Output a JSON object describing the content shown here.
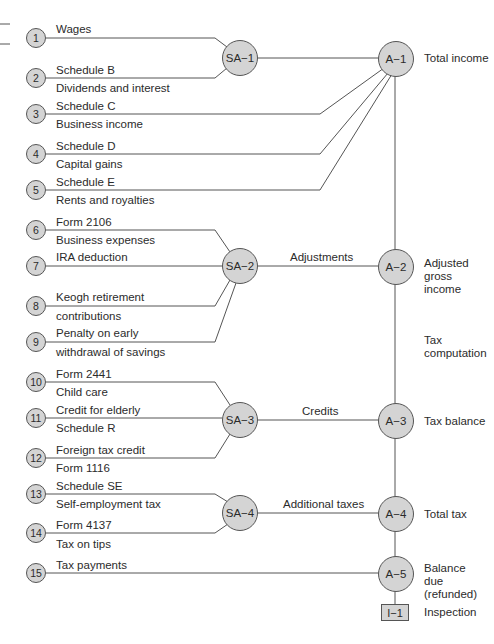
{
  "sources": [
    {
      "num": "1",
      "top": "Wages",
      "bottom": ""
    },
    {
      "num": "2",
      "top": "Schedule B",
      "bottom": "Dividends and interest"
    },
    {
      "num": "3",
      "top": "Schedule C",
      "bottom": "Business income"
    },
    {
      "num": "4",
      "top": "Schedule D",
      "bottom": "Capital gains"
    },
    {
      "num": "5",
      "top": "Schedule E",
      "bottom": "Rents and royalties"
    },
    {
      "num": "6",
      "top": "Form 2106",
      "bottom": "Business expenses"
    },
    {
      "num": "7",
      "top": "IRA deduction",
      "bottom": ""
    },
    {
      "num": "8",
      "top": "Keogh retirement",
      "bottom": "contributions"
    },
    {
      "num": "9",
      "top": "Penalty on early",
      "bottom": "withdrawal of savings"
    },
    {
      "num": "10",
      "top": "Form 2441",
      "bottom": "Child care"
    },
    {
      "num": "11",
      "top": "Credit for elderly",
      "bottom": "Schedule R"
    },
    {
      "num": "12",
      "top": "Foreign tax credit",
      "bottom": "Form 1116"
    },
    {
      "num": "13",
      "top": "Schedule SE",
      "bottom": "Self-employment tax"
    },
    {
      "num": "14",
      "top": "Form 4137",
      "bottom": "Tax on tips"
    },
    {
      "num": "15",
      "top": "Tax payments",
      "bottom": ""
    }
  ],
  "sub_assemblies": [
    {
      "id": "SA−1",
      "edge_label": ""
    },
    {
      "id": "SA−2",
      "edge_label": "Adjustments"
    },
    {
      "id": "SA−3",
      "edge_label": "Credits"
    },
    {
      "id": "SA−4",
      "edge_label": "Additional taxes"
    }
  ],
  "assemblies": [
    {
      "id": "A−1",
      "label": "Total income"
    },
    {
      "id": "A−2",
      "label": "Adjusted gross income"
    },
    {
      "id": "A−3",
      "label": "Tax balance"
    },
    {
      "id": "A−4",
      "label": "Total tax"
    },
    {
      "id": "A−5",
      "label": "Balance due (refunded)"
    }
  ],
  "segment_label": "Tax computation",
  "inspection": {
    "id": "I−1",
    "label": "Inspection"
  },
  "colors": {
    "node_fill": "#d4d4d4",
    "line": "#555555",
    "text": "#2b2b2b"
  }
}
